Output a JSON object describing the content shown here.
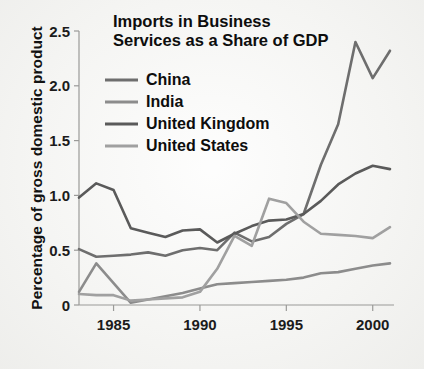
{
  "chart_data": {
    "type": "line",
    "title_line1": "Imports in Business",
    "title_line2": "Services as a Share of GDP",
    "xlabel": "",
    "ylabel": "Percentage of gross domestic product",
    "xlim": [
      1983,
      2001
    ],
    "ylim": [
      0,
      2.5
    ],
    "x_ticks": [
      "1985",
      "1990",
      "1995",
      "2000"
    ],
    "x_tick_values": [
      1985,
      1990,
      1995,
      2000
    ],
    "y_ticks": [
      "0",
      "0.5",
      "1.0",
      "1.5",
      "2.0",
      "2.5"
    ],
    "y_tick_values": [
      0,
      0.5,
      1.0,
      1.5,
      2.0,
      2.5
    ],
    "grid": false,
    "legend_position": "upper-left-inside",
    "x": [
      1983,
      1984,
      1985,
      1986,
      1987,
      1988,
      1989,
      1990,
      1991,
      1992,
      1993,
      1994,
      1995,
      1996,
      1997,
      1998,
      1999,
      2000,
      2001
    ],
    "series": [
      {
        "name": "China",
        "color": "#6e6e6e",
        "values": [
          0.51,
          0.44,
          0.45,
          0.46,
          0.48,
          0.45,
          0.5,
          0.52,
          0.5,
          0.66,
          0.58,
          0.62,
          0.74,
          0.83,
          1.28,
          1.65,
          2.4,
          2.07,
          2.32
        ]
      },
      {
        "name": "India",
        "color": "#8c8c8c",
        "values": [
          0.12,
          0.38,
          0.2,
          0.02,
          0.05,
          0.08,
          0.11,
          0.15,
          0.19,
          0.2,
          0.21,
          0.22,
          0.23,
          0.25,
          0.29,
          0.3,
          0.33,
          0.36,
          0.38
        ]
      },
      {
        "name": "United Kingdom",
        "color": "#5a5a5a",
        "values": [
          0.98,
          1.11,
          1.05,
          0.7,
          0.66,
          0.62,
          0.68,
          0.69,
          0.57,
          0.65,
          0.72,
          0.77,
          0.78,
          0.83,
          0.95,
          1.1,
          1.2,
          1.27,
          1.24
        ]
      },
      {
        "name": "United States",
        "color": "#a0a0a0",
        "values": [
          0.1,
          0.09,
          0.09,
          0.04,
          0.05,
          0.06,
          0.07,
          0.12,
          0.33,
          0.63,
          0.54,
          0.97,
          0.93,
          0.76,
          0.65,
          0.64,
          0.63,
          0.61,
          0.71
        ]
      }
    ]
  }
}
